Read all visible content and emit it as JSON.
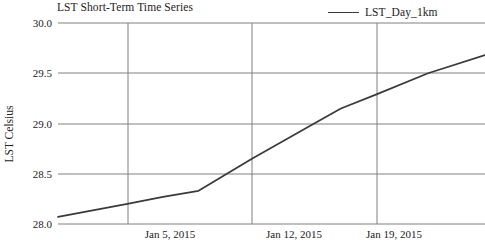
{
  "chart_data": {
    "type": "line",
    "title": "LST Short-Term Time Series",
    "xlabel": "",
    "ylabel": "LST Celsius",
    "ylim": [
      28.0,
      30.0
    ],
    "yticks": [
      "28.0",
      "28.5",
      "29.0",
      "29.5",
      "30.0"
    ],
    "ytick_values": [
      28.0,
      28.5,
      29.0,
      29.5,
      30.0
    ],
    "xtick_labels": [
      "Jan 5, 2015",
      "Jan 12, 2015",
      "Jan 19, 2015"
    ],
    "xtick_days": [
      5,
      12,
      19
    ],
    "xlim_days": [
      1.1,
      25.1
    ],
    "grid": "both",
    "legend_position": "top-right",
    "series": [
      {
        "name": "LST_Day_1km",
        "color": "#3a3a3a",
        "x_days": [
          1.1,
          5.0,
          7.0,
          9.0,
          12.0,
          15.5,
          17.0,
          19.0,
          21.9,
          25.1
        ],
        "values": [
          28.07,
          28.2,
          28.27,
          28.33,
          28.65,
          29.0,
          29.15,
          29.29,
          29.5,
          29.68
        ]
      }
    ],
    "colors": {
      "grid": "#808080",
      "axis": "#808080",
      "line": "#3a3a3a",
      "text": "#222222",
      "background": "#ffffff"
    }
  }
}
